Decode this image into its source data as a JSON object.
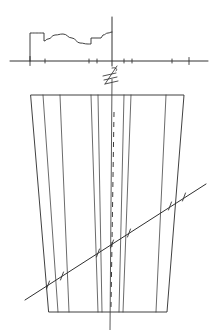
{
  "drawing": {
    "title": "Hand-drawn section and plan view",
    "ink_color": "#2b2b2b",
    "background_color": "#ffffff",
    "width": 214,
    "height": 336
  },
  "centerline_symbol": {
    "name": "centerline-mark",
    "label": "℄",
    "x": 110,
    "y": 74
  },
  "chart_data": {
    "type": "line",
    "title": "",
    "xlabel": "",
    "ylabel": "",
    "grid": false,
    "legend": false,
    "xlim": [
      0,
      214
    ],
    "ylim": [
      0,
      28
    ],
    "baseline_y": 61,
    "axis": {
      "name": "baseline-axis",
      "x_start": 10,
      "x_end": 208,
      "y": 61
    },
    "ticks": [
      {
        "x": 30,
        "height": 9
      },
      {
        "x": 45,
        "height": 4
      },
      {
        "x": 89,
        "height": 4
      },
      {
        "x": 97,
        "height": 4
      },
      {
        "x": 124,
        "height": 4
      },
      {
        "x": 132,
        "height": 4
      },
      {
        "x": 172,
        "height": 4
      },
      {
        "x": 189,
        "height": 7
      }
    ],
    "vertical_axis": {
      "name": "profile-vertical-axis",
      "x": 112,
      "y_top": 17,
      "y_bottom": 66
    },
    "profile_points": [
      [
        30,
        61
      ],
      [
        30,
        33
      ],
      [
        44,
        33
      ],
      [
        44,
        41
      ],
      [
        48,
        39
      ],
      [
        55,
        35
      ],
      [
        63,
        34
      ],
      [
        72,
        38
      ],
      [
        80,
        43
      ],
      [
        88,
        44
      ],
      [
        91,
        44
      ],
      [
        91,
        38
      ],
      [
        101,
        38
      ],
      [
        103,
        35
      ],
      [
        108,
        33
      ],
      [
        112,
        32
      ]
    ]
  },
  "plan_view": {
    "name": "plan-view-trapezoid",
    "outline": [
      [
        31,
        95
      ],
      [
        184,
        95
      ],
      [
        167,
        312
      ],
      [
        49,
        312
      ]
    ],
    "center_axis": {
      "name": "plan-center-axis",
      "x_top": 112,
      "y_top": 79,
      "x_bottom": 110,
      "y_bottom": 330
    },
    "longitudinal_lines": [
      {
        "name": "lane-line-1",
        "x_top": 43,
        "x_bottom": 58
      },
      {
        "name": "lane-line-2",
        "x_top": 60,
        "x_bottom": 69
      },
      {
        "name": "lane-line-3",
        "x_top": 91,
        "x_bottom": 98
      },
      {
        "name": "lane-line-4",
        "x_top": 98,
        "x_bottom": 102
      },
      {
        "name": "lane-line-5",
        "x_top": 124,
        "x_bottom": 119
      },
      {
        "name": "lane-line-6",
        "x_top": 131,
        "x_bottom": 123
      },
      {
        "name": "lane-line-7",
        "x_top": 166,
        "x_bottom": 156
      }
    ],
    "dashed_centerline": {
      "name": "plan-dashed-centerline",
      "x_top": 114,
      "y_top": 112,
      "x_bottom": 111,
      "y_bottom": 307
    },
    "section_line": {
      "name": "diagonal-section-line",
      "x1": 25,
      "y1": 300,
      "x2": 206,
      "y2": 184,
      "crossing_marks": [
        {
          "x": 48,
          "y": 285
        },
        {
          "x": 62,
          "y": 276
        },
        {
          "x": 98,
          "y": 253
        },
        {
          "x": 112,
          "y": 244
        },
        {
          "x": 129,
          "y": 233
        },
        {
          "x": 170,
          "y": 206
        },
        {
          "x": 184,
          "y": 197
        }
      ]
    }
  }
}
